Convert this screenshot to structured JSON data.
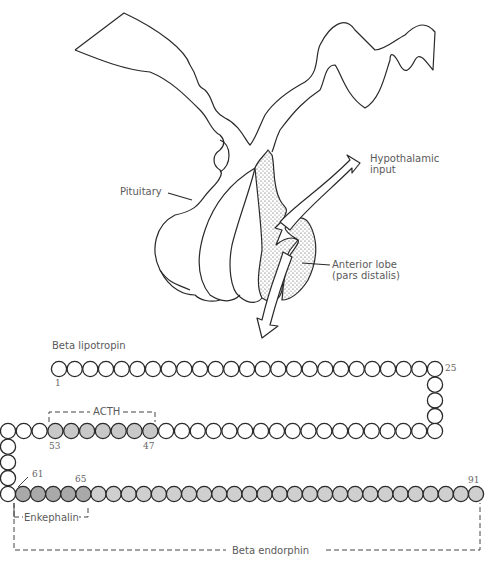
{
  "diagram": {
    "labels": {
      "pituitary": "Pituitary",
      "hypothalamic_line1": "Hypothalamic",
      "hypothalamic_line2": "input",
      "anterior_line1": "Anterior lobe",
      "anterior_line2": "(pars distalis)",
      "beta_lipotropin": "Beta lipotropin",
      "acth": "ACTH",
      "enkephalin": "Enkephalin",
      "beta_endorphin": "Beta endorphin"
    },
    "residue_numbers": {
      "n1": "1",
      "n25": "25",
      "n53": "53",
      "n47": "47",
      "n61": "61",
      "n65": "65",
      "n91": "91"
    },
    "chain": {
      "total_residues": 91,
      "acth_segment": [
        47,
        53
      ],
      "enkephalin_segment": [
        61,
        65
      ],
      "beta_endorphin_segment": [
        61,
        91
      ]
    },
    "colors": {
      "line": "#2a2a2a",
      "stipple": "#555555",
      "acth_fill": "#c8c8c8",
      "enkephalin_fill": "#a9a9a9",
      "endorphin_fill": "#cfcfcf",
      "text": "#5a5a5a"
    }
  }
}
